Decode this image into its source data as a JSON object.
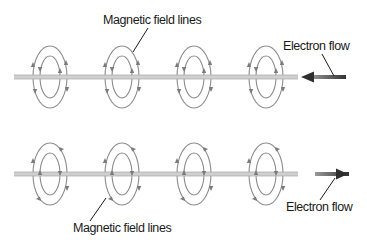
{
  "diagram": {
    "title": "",
    "colors": {
      "wire": "#c4c4c4",
      "wire_edge": "#9a9a9a",
      "ring": "#8c8c8c",
      "arrow": "#3a3a3a",
      "label": "#1a1a1a"
    },
    "rows": [
      {
        "id": "top",
        "wire_y": 77,
        "ring_centers_x": [
          50,
          122,
          194,
          266
        ],
        "field_direction": "counterclockwise-front-up",
        "electron_flow_direction": "left",
        "labels": {
          "field": "Magnetic field lines",
          "flow": "Electron flow"
        }
      },
      {
        "id": "bottom",
        "wire_y": 174,
        "ring_centers_x": [
          50,
          122,
          194,
          266
        ],
        "field_direction": "clockwise-front-down",
        "electron_flow_direction": "right",
        "labels": {
          "field": "Magnetic field lines",
          "flow": "Electron flow"
        }
      }
    ]
  }
}
